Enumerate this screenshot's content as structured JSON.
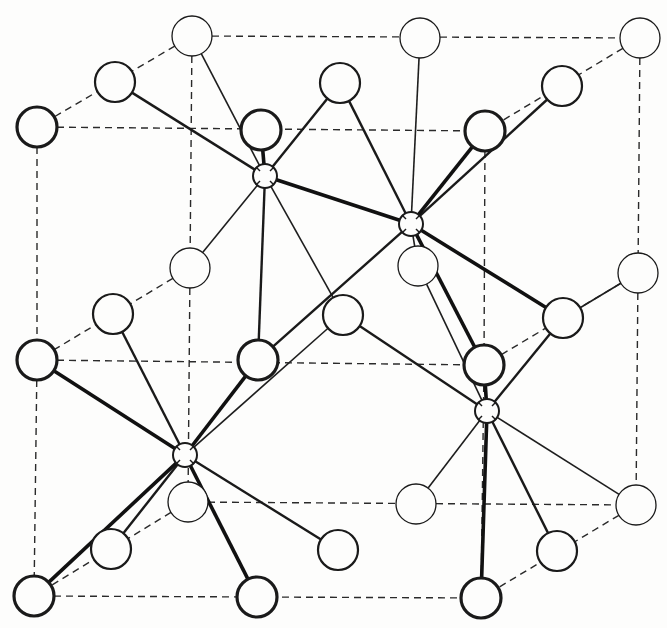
{
  "diagram": {
    "title": "Crystal structure unit cell (cations octahedrally coordinated by anions)",
    "colors": {
      "ink": "#1a1a1a",
      "paper": "#fdfdfc"
    },
    "legend": {
      "large_circle": "anion",
      "small_circle": "cation"
    },
    "anions": [
      {
        "id": "A",
        "x": 192,
        "y": 36,
        "w": 1.3
      },
      {
        "id": "B",
        "x": 115,
        "y": 82,
        "w": 2.2
      },
      {
        "id": "C",
        "x": 37,
        "y": 127,
        "w": 3.2
      },
      {
        "id": "D",
        "x": 420,
        "y": 38,
        "w": 1.3
      },
      {
        "id": "E",
        "x": 640,
        "y": 38,
        "w": 1.3
      },
      {
        "id": "F",
        "x": 562,
        "y": 86,
        "w": 2.2
      },
      {
        "id": "G",
        "x": 485,
        "y": 131,
        "w": 3.2
      },
      {
        "id": "H",
        "x": 261,
        "y": 130,
        "w": 3.2
      },
      {
        "id": "I",
        "x": 340,
        "y": 83,
        "w": 2.2
      },
      {
        "id": "J",
        "x": 190,
        "y": 268,
        "w": 1.3
      },
      {
        "id": "K",
        "x": 113,
        "y": 314,
        "w": 2.2
      },
      {
        "id": "L",
        "x": 37,
        "y": 360,
        "w": 3.2
      },
      {
        "id": "M",
        "x": 418,
        "y": 266,
        "w": 1.3
      },
      {
        "id": "N",
        "x": 343,
        "y": 315,
        "w": 2.2
      },
      {
        "id": "O",
        "x": 258,
        "y": 360,
        "w": 3.2
      },
      {
        "id": "P",
        "x": 484,
        "y": 365,
        "w": 3.2
      },
      {
        "id": "Q",
        "x": 563,
        "y": 318,
        "w": 2.2
      },
      {
        "id": "R",
        "x": 638,
        "y": 273,
        "w": 1.3
      },
      {
        "id": "S",
        "x": 188,
        "y": 502,
        "w": 1.3
      },
      {
        "id": "T",
        "x": 111,
        "y": 549,
        "w": 2.2
      },
      {
        "id": "U",
        "x": 34,
        "y": 596,
        "w": 3.2
      },
      {
        "id": "V",
        "x": 416,
        "y": 504,
        "w": 1.3
      },
      {
        "id": "W",
        "x": 557,
        "y": 551,
        "w": 2.2
      },
      {
        "id": "X",
        "x": 481,
        "y": 598,
        "w": 3.2
      },
      {
        "id": "Y",
        "x": 636,
        "y": 505,
        "w": 1.3
      },
      {
        "id": "Z",
        "x": 257,
        "y": 597,
        "w": 3.2
      },
      {
        "id": "AA",
        "x": 338,
        "y": 550,
        "w": 2.2
      }
    ],
    "cations": [
      {
        "id": "c1",
        "x": 265,
        "y": 176
      },
      {
        "id": "c2",
        "x": 411,
        "y": 224
      },
      {
        "id": "c3",
        "x": 185,
        "y": 455
      },
      {
        "id": "c4",
        "x": 487,
        "y": 411
      }
    ],
    "cell_edges": [
      [
        "C",
        "L"
      ],
      [
        "L",
        "U"
      ],
      [
        "C",
        "G"
      ],
      [
        "L",
        "P"
      ],
      [
        "U",
        "X"
      ],
      [
        "G",
        "P"
      ],
      [
        "P",
        "X"
      ],
      [
        "A",
        "E"
      ],
      [
        "E",
        "R"
      ],
      [
        "R",
        "Y"
      ],
      [
        "A",
        "J"
      ],
      [
        "J",
        "S"
      ],
      [
        "S",
        "Y"
      ],
      [
        "A",
        "C"
      ],
      [
        "E",
        "G"
      ],
      [
        "Y",
        "X"
      ],
      [
        "S",
        "U"
      ],
      [
        "J",
        "L"
      ],
      [
        "R",
        "P"
      ]
    ],
    "bonds": [
      [
        "c1",
        "A",
        "thin"
      ],
      [
        "c1",
        "B",
        "med"
      ],
      [
        "c1",
        "H",
        "thick"
      ],
      [
        "c1",
        "I",
        "med"
      ],
      [
        "c1",
        "J",
        "thin"
      ],
      [
        "c1",
        "O",
        "med"
      ],
      [
        "c1",
        "N",
        "thin"
      ],
      [
        "c1",
        "c2",
        "thick"
      ],
      [
        "c2",
        "D",
        "thin"
      ],
      [
        "c2",
        "F",
        "med"
      ],
      [
        "c2",
        "G",
        "thick"
      ],
      [
        "c2",
        "I",
        "med"
      ],
      [
        "c2",
        "M",
        "thin"
      ],
      [
        "c2",
        "P",
        "thick"
      ],
      [
        "c2",
        "Q",
        "thick"
      ],
      [
        "c2",
        "O",
        "med"
      ],
      [
        "c3",
        "K",
        "med"
      ],
      [
        "c3",
        "L",
        "thick"
      ],
      [
        "c3",
        "O",
        "thick"
      ],
      [
        "c3",
        "N",
        "thin"
      ],
      [
        "c3",
        "T",
        "med"
      ],
      [
        "c3",
        "U",
        "thick"
      ],
      [
        "c3",
        "Z",
        "thick"
      ],
      [
        "c3",
        "AA",
        "med"
      ],
      [
        "c4",
        "P",
        "thick"
      ],
      [
        "c4",
        "Q",
        "med"
      ],
      [
        "c4",
        "M",
        "thin"
      ],
      [
        "c4",
        "V",
        "thin"
      ],
      [
        "c4",
        "X",
        "thick"
      ],
      [
        "c4",
        "W",
        "med"
      ],
      [
        "c4",
        "Y",
        "thin"
      ],
      [
        "c4",
        "N",
        "med"
      ],
      [
        "Q",
        "R",
        "thin"
      ]
    ]
  }
}
